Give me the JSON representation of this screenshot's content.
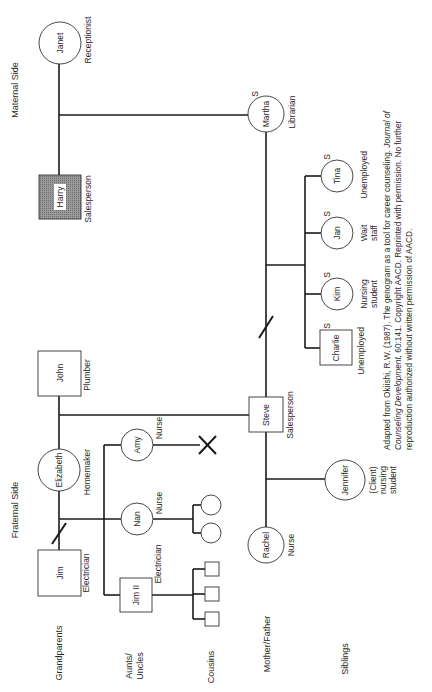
{
  "diagram": {
    "type": "genogram",
    "orientation": "rotated-90-ccw",
    "side_labels": {
      "maternal": "Maternal Side",
      "fraternal": "Fraternal Side"
    },
    "generation_labels": {
      "grandparents": "Grandparents",
      "aunts_uncles_line1": "Aunts/",
      "aunts_uncles_line2": "Uncles",
      "cousins": "Cousins",
      "mother_father": "Mother/Father",
      "siblings": "Siblings"
    },
    "people": {
      "janet": {
        "name": "Janet",
        "sex": "female",
        "occupation": "Receptionist"
      },
      "harry": {
        "name": "Harry",
        "sex": "male",
        "occupation": "Salesperson",
        "shaded": true
      },
      "martha": {
        "name": "Martha",
        "sex": "female",
        "occupation": "Librarian",
        "marker": "S"
      },
      "john": {
        "name": "John",
        "sex": "male",
        "occupation": "Plumber"
      },
      "elizabeth": {
        "name": "Elizabeth",
        "sex": "female",
        "occupation": "Homemaker"
      },
      "jim": {
        "name": "Jim",
        "sex": "male",
        "occupation": "Electrician"
      },
      "amy": {
        "name": "Amy",
        "sex": "female",
        "occupation": "Nurse"
      },
      "nan": {
        "name": "Nan",
        "sex": "female",
        "occupation": "Nurse"
      },
      "jim2": {
        "name": "Jim II",
        "sex": "male",
        "occupation": "Electrician"
      },
      "steve": {
        "name": "Steve",
        "sex": "male",
        "occupation": "Salesperson"
      },
      "rachel": {
        "name": "Rachel",
        "sex": "female",
        "occupation": "Nurse"
      },
      "jennifer": {
        "name": "Jennifer",
        "sex": "female",
        "occupation_line1": "(Client)",
        "occupation_line2": "nursing",
        "occupation_line3": "student"
      },
      "charlie": {
        "name": "Charlie",
        "sex": "male",
        "occupation": "Unemployed",
        "marker": "S"
      },
      "kim": {
        "name": "Kim",
        "sex": "female",
        "occupation_line1": "Nursing",
        "occupation_line2": "student",
        "marker": "S"
      },
      "jan": {
        "name": "Jan",
        "sex": "female",
        "occupation_line1": "Wait",
        "occupation_line2": "staff",
        "marker": "S"
      },
      "tina": {
        "name": "Tina",
        "sex": "female",
        "occupation": "Unemployed",
        "marker": "S"
      }
    },
    "citation": {
      "line1_pre": "Adapted from Okiishi, R.W. (1987). The genogram as a tool for career counseling. ",
      "line1_italic": "Journal of",
      "line2_italic": "Counseling Development,",
      "line2_post": " 60:141. Copyright AACD. Reprinted with permission. No further",
      "line3": "reproduction authorized without written permission of AACD."
    }
  }
}
